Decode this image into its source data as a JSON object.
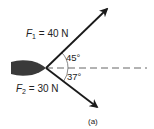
{
  "diagram": {
    "forces": [
      {
        "symbol": "F",
        "subscript": "1",
        "value_text": "= 40 N",
        "magnitude": 40,
        "unit": "N",
        "angle_deg": 45,
        "direction": "above horizontal"
      },
      {
        "symbol": "F",
        "subscript": "2",
        "value_text": "= 30 N",
        "magnitude": 30,
        "unit": "N",
        "angle_deg": 37,
        "direction": "below horizontal"
      }
    ],
    "angles": [
      "45°",
      "37°"
    ],
    "caption": "(a)",
    "colors": {
      "arrow": "#1a1a1a",
      "body": "#3a3a3a",
      "dashed": "#555555"
    }
  }
}
